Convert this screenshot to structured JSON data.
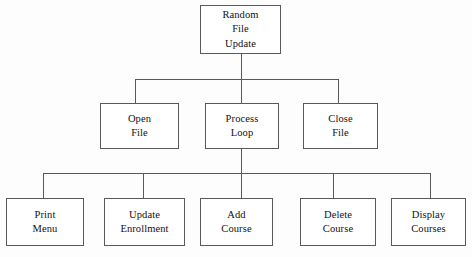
{
  "diagram": {
    "stroke_color": "#595959",
    "box_fill": "#ffffff",
    "text_color": "#111111",
    "canvas": {
      "width": 472,
      "height": 257
    }
  },
  "nodes": [
    {
      "id": "random-file-update",
      "name": "node-random-file-update",
      "level": 1,
      "lines": [
        "Random",
        "File",
        "Update"
      ],
      "x": 200,
      "y": 5,
      "w": 81,
      "h": 49
    },
    {
      "id": "open-file",
      "name": "node-open-file",
      "level": 2,
      "lines": [
        "Open",
        "File"
      ],
      "x": 100,
      "y": 103,
      "w": 79,
      "h": 46
    },
    {
      "id": "process-loop",
      "name": "node-process-loop",
      "level": 2,
      "lines": [
        "Process",
        "Loop"
      ],
      "x": 205,
      "y": 103,
      "w": 74,
      "h": 46
    },
    {
      "id": "close-file",
      "name": "node-close-file",
      "level": 2,
      "lines": [
        "Close",
        "File"
      ],
      "x": 303,
      "y": 103,
      "w": 75,
      "h": 46
    },
    {
      "id": "print-menu",
      "name": "node-print-menu",
      "level": 3,
      "lines": [
        "Print",
        "Menu"
      ],
      "x": 6,
      "y": 198,
      "w": 78,
      "h": 48
    },
    {
      "id": "update-enrollment",
      "name": "node-update-enrollment",
      "level": 3,
      "lines": [
        "Update",
        "Enrollment"
      ],
      "x": 104,
      "y": 198,
      "w": 81,
      "h": 48
    },
    {
      "id": "add-course",
      "name": "node-add-course",
      "level": 3,
      "lines": [
        "Add",
        "Course"
      ],
      "x": 200,
      "y": 198,
      "w": 73,
      "h": 48
    },
    {
      "id": "delete-course",
      "name": "node-delete-course",
      "level": 3,
      "lines": [
        "Delete",
        "Course"
      ],
      "x": 300,
      "y": 198,
      "w": 76,
      "h": 48
    },
    {
      "id": "display-courses",
      "name": "node-display-courses",
      "level": 3,
      "lines": [
        "Display",
        "Courses"
      ],
      "x": 391,
      "y": 198,
      "w": 75,
      "h": 48
    }
  ],
  "connectors": {
    "upper": {
      "parent_stem": {
        "x": 241,
        "y1": 54,
        "y2": 79
      },
      "bus": {
        "x1": 135,
        "x2": 338,
        "y": 79
      },
      "drops": [
        {
          "name": "drop-open-file",
          "x": 135,
          "y1": 79,
          "y2": 103
        },
        {
          "name": "drop-process-loop",
          "x": 241,
          "y1": 79,
          "y2": 103
        },
        {
          "name": "drop-close-file",
          "x": 338,
          "y1": 79,
          "y2": 103
        }
      ]
    },
    "lower": {
      "parent_stem": {
        "x": 241,
        "y1": 149,
        "y2": 173
      },
      "bus": {
        "x1": 43,
        "x2": 430,
        "y": 173
      },
      "drops": [
        {
          "name": "drop-print-menu",
          "x": 43,
          "y1": 173,
          "y2": 198
        },
        {
          "name": "drop-update-enrollment",
          "x": 143,
          "y1": 173,
          "y2": 198
        },
        {
          "name": "drop-add-course",
          "x": 241,
          "y1": 173,
          "y2": 198
        },
        {
          "name": "drop-delete-course",
          "x": 333,
          "y1": 173,
          "y2": 198
        },
        {
          "name": "drop-display-courses",
          "x": 430,
          "y1": 173,
          "y2": 198
        }
      ]
    }
  }
}
